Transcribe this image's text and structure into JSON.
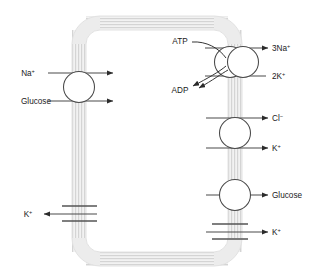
{
  "diagram": {
    "membrane": {
      "name": "plasma-membrane",
      "style": "lipid-bilayer-hatched",
      "color": "#dcdcdc"
    },
    "colors": {
      "membrane": "#dcdcdc",
      "arrow": "#4a4a4a",
      "protein_stroke": "#4a4a4a",
      "protein_fill": "#ffffff",
      "text": "#1a1a1a",
      "background": "#ffffff"
    },
    "transporters": [
      {
        "id": "na-glucose-symporter",
        "type": "carrier-circle",
        "side": "left",
        "inputs": [
          {
            "label": "Na",
            "charge": "+",
            "direction": "inward-right"
          },
          {
            "label": "Glucose",
            "charge": "",
            "direction": "inward-right"
          }
        ]
      },
      {
        "id": "sodium-potassium-atpase",
        "type": "pump-double-circle",
        "side": "right-top",
        "energy_in": "ATP",
        "energy_out": "ADP",
        "outputs": [
          {
            "label": "3Na",
            "charge": "+",
            "direction": "outward-right"
          },
          {
            "label": "2K",
            "charge": "+",
            "direction": "inward-left"
          }
        ]
      },
      {
        "id": "chloride-potassium-transporter",
        "type": "carrier-circle",
        "side": "right-middle",
        "outputs": [
          {
            "label": "Cl",
            "charge": "−",
            "direction": "outward-right"
          },
          {
            "label": "K",
            "charge": "+",
            "direction": "outward-right"
          }
        ]
      },
      {
        "id": "glucose-transporter",
        "type": "carrier-circle",
        "side": "right-lower",
        "outputs": [
          {
            "label": "Glucose",
            "charge": "",
            "direction": "outward-right"
          }
        ]
      },
      {
        "id": "potassium-channel-right",
        "type": "gated-channel",
        "side": "right-bottom",
        "outputs": [
          {
            "label": "K",
            "charge": "+",
            "direction": "outward-right"
          }
        ]
      },
      {
        "id": "potassium-channel-left",
        "type": "gated-channel",
        "side": "left-bottom",
        "outputs": [
          {
            "label": "K",
            "charge": "+",
            "direction": "outward-left"
          }
        ]
      }
    ],
    "labels": {
      "na_left": "Na",
      "na_left_sup": "+",
      "glucose_left": "Glucose",
      "atp": "ATP",
      "adp": "ADP",
      "three_na": "3Na",
      "three_na_sup": "+",
      "two_k": "2K",
      "two_k_sup": "+",
      "cl": "Cl",
      "cl_sup": "−",
      "k_mid": "K",
      "k_mid_sup": "+",
      "glucose_right": "Glucose",
      "k_bottom_right": "K",
      "k_bottom_right_sup": "+",
      "k_bottom_left": "K",
      "k_bottom_left_sup": "+"
    }
  }
}
